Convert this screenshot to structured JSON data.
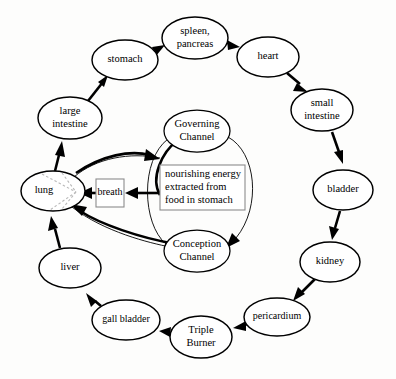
{
  "diagram": {
    "background_color": "#fdfdfc",
    "line_color": "#000000",
    "nodes": [
      {
        "id": "stomach",
        "label": "stomach",
        "lines": [
          "stomach"
        ],
        "cx": 125,
        "cy": 60,
        "rx": 33,
        "ry": 20
      },
      {
        "id": "spleen_pancreas",
        "label": "spleen, pancreas",
        "lines": [
          "spleen,",
          "pancreas"
        ],
        "cx": 195,
        "cy": 38,
        "rx": 33,
        "ry": 21
      },
      {
        "id": "heart",
        "label": "heart",
        "lines": [
          "heart"
        ],
        "cx": 268,
        "cy": 57,
        "rx": 31,
        "ry": 20
      },
      {
        "id": "small_intestine",
        "label": "small intestine",
        "lines": [
          "small",
          "intestine"
        ],
        "cx": 322,
        "cy": 110,
        "rx": 31,
        "ry": 21
      },
      {
        "id": "bladder",
        "label": "bladder",
        "lines": [
          "bladder"
        ],
        "cx": 343,
        "cy": 190,
        "rx": 30,
        "ry": 20
      },
      {
        "id": "kidney",
        "label": "kidney",
        "lines": [
          "kidney"
        ],
        "cx": 330,
        "cy": 262,
        "rx": 30,
        "ry": 20
      },
      {
        "id": "pericardium",
        "label": "pericardium",
        "lines": [
          "pericardium"
        ],
        "cx": 277,
        "cy": 317,
        "rx": 33,
        "ry": 19
      },
      {
        "id": "triple_burner",
        "label": "Triple Burner",
        "lines": [
          "Triple",
          "Burner"
        ],
        "cx": 201,
        "cy": 337,
        "rx": 31,
        "ry": 21
      },
      {
        "id": "gall_bladder",
        "label": "gall bladder",
        "lines": [
          "gall bladder"
        ],
        "cx": 126,
        "cy": 320,
        "rx": 34,
        "ry": 20
      },
      {
        "id": "liver",
        "label": "liver",
        "lines": [
          "liver"
        ],
        "cx": 70,
        "cy": 268,
        "rx": 31,
        "ry": 20
      },
      {
        "id": "lung",
        "label": "lung",
        "lines": [
          "lung"
        ],
        "cx": 53,
        "cy": 191,
        "rx": 32,
        "ry": 20
      },
      {
        "id": "large_intestine",
        "label": "large intestine",
        "lines": [
          "large",
          "intestine"
        ],
        "cx": 70,
        "cy": 118,
        "rx": 32,
        "ry": 21
      },
      {
        "id": "governing_channel",
        "label": "Governing Channel",
        "lines": [
          "Governing",
          "Channel"
        ],
        "cx": 197,
        "cy": 131,
        "rx": 33,
        "ry": 21
      },
      {
        "id": "conception_channel",
        "label": "Conception Channel",
        "lines": [
          "Conception",
          "Channel"
        ],
        "cx": 197,
        "cy": 251,
        "rx": 33,
        "ry": 21
      }
    ],
    "boxes": [
      {
        "id": "breath",
        "label": "breath",
        "lines": [
          "breath"
        ],
        "x": 96,
        "y": 179,
        "w": 28,
        "h": 28
      },
      {
        "id": "nourishing_energy",
        "label": "nourishing energy extracted from food in stomach",
        "lines": [
          "nourishing energy",
          "extracted from",
          "food in stomach"
        ],
        "x": 160,
        "y": 165,
        "w": 85,
        "h": 45
      }
    ],
    "edges": [
      {
        "from": "large_intestine",
        "to": "stomach",
        "style": "thick"
      },
      {
        "from": "stomach",
        "to": "spleen_pancreas",
        "style": "thick"
      },
      {
        "from": "spleen_pancreas",
        "to": "heart",
        "style": "thick"
      },
      {
        "from": "heart",
        "to": "small_intestine",
        "style": "thick"
      },
      {
        "from": "small_intestine",
        "to": "bladder",
        "style": "thick"
      },
      {
        "from": "bladder",
        "to": "kidney",
        "style": "thick"
      },
      {
        "from": "kidney",
        "to": "pericardium",
        "style": "thick"
      },
      {
        "from": "pericardium",
        "to": "triple_burner",
        "style": "thick"
      },
      {
        "from": "triple_burner",
        "to": "gall_bladder",
        "style": "thick"
      },
      {
        "from": "gall_bladder",
        "to": "liver",
        "style": "thick"
      },
      {
        "from": "liver",
        "to": "lung",
        "style": "thick"
      },
      {
        "from": "lung",
        "to": "large_intestine",
        "style": "thick"
      },
      {
        "from": "nourishing_energy",
        "to": "breath",
        "style": "thin-straight"
      },
      {
        "from": "breath",
        "to": "lung",
        "style": "thin-straight"
      },
      {
        "from": "breath",
        "to": "governing_channel",
        "style": "thick-curve"
      },
      {
        "from": "conception_channel",
        "to": "lung",
        "style": "thick-curve"
      },
      {
        "from": "governing_channel",
        "to": "conception_channel",
        "style": "thin-curve-right"
      },
      {
        "from": "conception_channel",
        "to": "governing_channel",
        "style": "thin-curve-left"
      }
    ]
  }
}
